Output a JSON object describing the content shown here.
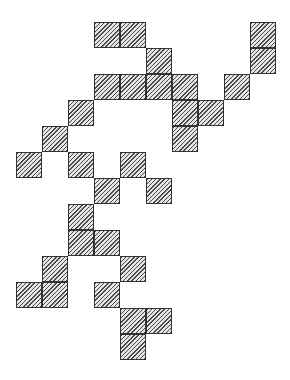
{
  "diagram": {
    "type": "polyomino-grid",
    "grid": {
      "origin_x": 16,
      "origin_y": 22,
      "cell_size": 26,
      "columns": 10,
      "rows": 13
    },
    "fill": {
      "pattern": "diagonal-hatch",
      "line_color": "#4a4a4a",
      "background": "#e6e6e6",
      "border": "#333333"
    },
    "cells": [
      {
        "col": 3,
        "row": 0
      },
      {
        "col": 4,
        "row": 0
      },
      {
        "col": 9,
        "row": 0
      },
      {
        "col": 5,
        "row": 1
      },
      {
        "col": 9,
        "row": 1
      },
      {
        "col": 3,
        "row": 2
      },
      {
        "col": 4,
        "row": 2
      },
      {
        "col": 5,
        "row": 2
      },
      {
        "col": 6,
        "row": 2
      },
      {
        "col": 8,
        "row": 2
      },
      {
        "col": 2,
        "row": 3
      },
      {
        "col": 6,
        "row": 3
      },
      {
        "col": 7,
        "row": 3
      },
      {
        "col": 1,
        "row": 4
      },
      {
        "col": 6,
        "row": 4
      },
      {
        "col": 0,
        "row": 5
      },
      {
        "col": 2,
        "row": 5
      },
      {
        "col": 4,
        "row": 5
      },
      {
        "col": 3,
        "row": 6
      },
      {
        "col": 5,
        "row": 6
      },
      {
        "col": 2,
        "row": 7
      },
      {
        "col": 2,
        "row": 8
      },
      {
        "col": 3,
        "row": 8
      },
      {
        "col": 1,
        "row": 9
      },
      {
        "col": 4,
        "row": 9
      },
      {
        "col": 0,
        "row": 10
      },
      {
        "col": 1,
        "row": 10
      },
      {
        "col": 3,
        "row": 10
      },
      {
        "col": 4,
        "row": 11
      },
      {
        "col": 5,
        "row": 11
      },
      {
        "col": 4,
        "row": 12
      }
    ]
  }
}
